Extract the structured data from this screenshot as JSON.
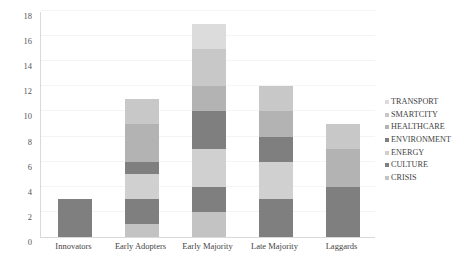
{
  "chart_data": {
    "type": "bar",
    "variant": "stacked-bar",
    "title": "",
    "subtitle": "",
    "xlabel": "",
    "ylabel": "",
    "ylim": [
      0,
      18
    ],
    "y_ticks": [
      0,
      2,
      4,
      6,
      8,
      10,
      12,
      14,
      16,
      18
    ],
    "grid": true,
    "grid_axis": "y",
    "legend_position": "right",
    "categories": [
      "Innovators",
      "Early Adopters",
      "Early Majority",
      "Late Majority",
      "Laggards"
    ],
    "series": [
      {
        "name": "CRISIS",
        "color": "#c3c3c3",
        "values": [
          0,
          1,
          2,
          0,
          0
        ]
      },
      {
        "name": "CULTURE",
        "color": "#7f7f7f",
        "values": [
          3,
          2,
          2,
          3,
          4
        ]
      },
      {
        "name": "ENERGY",
        "color": "#d0d0d0",
        "values": [
          0,
          2,
          3,
          3,
          0
        ]
      },
      {
        "name": "ENVIRONMENT",
        "color": "#7f7f7f",
        "values": [
          0,
          1,
          3,
          2,
          0
        ]
      },
      {
        "name": "HEALTHCARE",
        "color": "#b3b3b3",
        "values": [
          0,
          3,
          2,
          2,
          3
        ]
      },
      {
        "name": "SMARTCITY",
        "color": "#c8c8c8",
        "values": [
          0,
          2,
          3,
          2,
          2
        ]
      },
      {
        "name": "TRANSPORT",
        "color": "#dcdcdc",
        "values": [
          0,
          0,
          2,
          0,
          0
        ]
      }
    ],
    "totals": [
      3,
      11,
      17,
      12,
      9
    ]
  },
  "legend": {
    "marker_icon": "square-marker-icon",
    "entries": [
      {
        "label": "TRANSPORT",
        "color": "#dcdcdc"
      },
      {
        "label": "SMARTCITY",
        "color": "#c8c8c8"
      },
      {
        "label": "HEALTHCARE",
        "color": "#b3b3b3"
      },
      {
        "label": "ENVIRONMENT",
        "color": "#7f7f7f"
      },
      {
        "label": "ENERGY",
        "color": "#d0d0d0"
      },
      {
        "label": "CULTURE",
        "color": "#7f7f7f"
      },
      {
        "label": "CRISIS",
        "color": "#c3c3c3"
      }
    ]
  },
  "axes": {
    "y_tick_labels": [
      "0",
      "2",
      "4",
      "6",
      "8",
      "10",
      "12",
      "14",
      "16",
      "18"
    ],
    "x_tick_labels": [
      "Innovators",
      "Early Adopters",
      "Early Majority",
      "Late Majority",
      "Laggards"
    ]
  },
  "style": {
    "background": "#ffffff",
    "gridline_color": "#f4f4f4",
    "axis_color": "#d9d9d9",
    "text_color": "#3f3f3f"
  }
}
